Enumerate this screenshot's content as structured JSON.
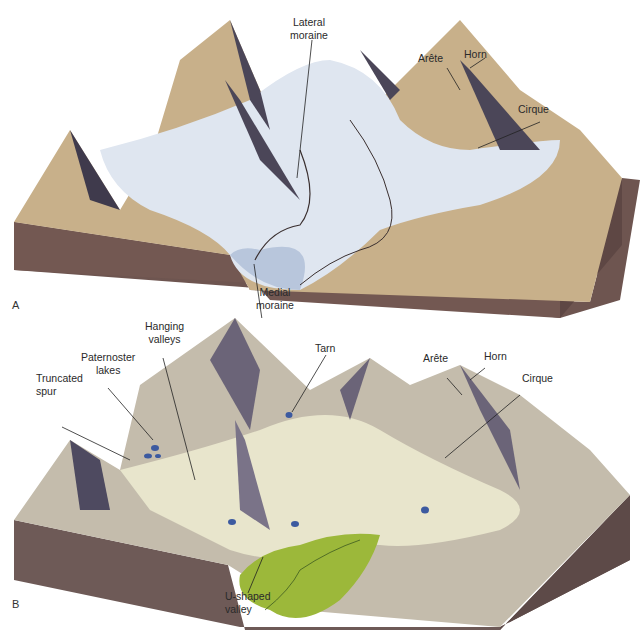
{
  "figure": {
    "panels": [
      {
        "id": "A",
        "letter": "A",
        "description": "Glaciated mountain landscape with active glaciers",
        "labels": {
          "lateral_moraine_1": "Lateral",
          "lateral_moraine_2": "moraine",
          "arete": "Arête",
          "horn": "Horn",
          "cirque": "Cirque",
          "medial_moraine_1": "Medial",
          "medial_moraine_2": "moraine"
        }
      },
      {
        "id": "B",
        "letter": "B",
        "description": "Same landscape after glaciers retreat",
        "labels": {
          "hanging_valleys_1": "Hanging",
          "hanging_valleys_2": "valleys",
          "paternoster_lakes_1": "Paternoster",
          "paternoster_lakes_2": "lakes",
          "truncated_spur_1": "Truncated",
          "truncated_spur_2": "spur",
          "tarn": "Tarn",
          "arete": "Arête",
          "horn": "Horn",
          "cirque": "Cirque",
          "u_shaped_valley_1": "U-shaped",
          "u_shaped_valley_2": "valley"
        }
      }
    ],
    "colors": {
      "bedrock": "#6e5550",
      "rock_tan": "#c8b08a",
      "ice": "#dfe6f0",
      "shadow": "#4b4658",
      "meadow": "#9cb83a",
      "lake": "#3c5aa0"
    }
  }
}
